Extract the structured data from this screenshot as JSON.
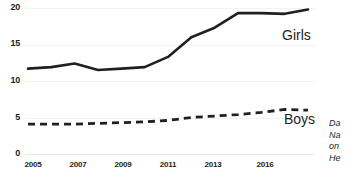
{
  "chart_data": {
    "type": "line",
    "title": "",
    "xlabel": "",
    "ylabel": "",
    "ylim": [
      0,
      20
    ],
    "yticks": [
      "0",
      "5",
      "10",
      "15",
      "20"
    ],
    "ytick_values": [
      0,
      5,
      10,
      15,
      20
    ],
    "grid": true,
    "legend_position": "inline-right",
    "x": [
      2005,
      2006,
      2007,
      2008,
      2009,
      2010,
      2011,
      2012,
      2013,
      2014,
      2015,
      2016,
      2017
    ],
    "xtick_labels": [
      "2005",
      "2007",
      "2009",
      "2011",
      "2013",
      "2016"
    ],
    "xtick_values": [
      2005,
      2007,
      2009,
      2011,
      2013,
      2016
    ],
    "series": [
      {
        "name": "Girls",
        "style": "solid",
        "color": "#231f20",
        "values": [
          11.7,
          11.9,
          12.4,
          11.5,
          11.7,
          11.9,
          13.3,
          16.0,
          17.3,
          19.3,
          19.3,
          19.2,
          19.8
        ]
      },
      {
        "name": "Boys",
        "style": "dashed",
        "color": "#231f20",
        "values": [
          4.1,
          4.1,
          4.1,
          4.2,
          4.3,
          4.4,
          4.6,
          5.0,
          5.2,
          5.4,
          5.7,
          6.1,
          6.0
        ]
      }
    ]
  },
  "labels": {
    "girls": "Girls",
    "boys": "Boys"
  },
  "note": {
    "line1": "Da",
    "line2": "Na",
    "line3": "on",
    "line4": "He"
  },
  "colors": {
    "ink": "#231f20",
    "gridline": "#f2f2f2",
    "background": "#ffffff"
  }
}
